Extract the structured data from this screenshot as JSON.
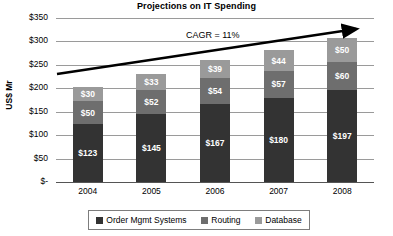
{
  "chart_data": {
    "type": "bar",
    "stacked": true,
    "title": "Projections on IT Spending",
    "xlabel": "",
    "ylabel": "US$ Mr",
    "categories": [
      "2004",
      "2005",
      "2006",
      "2007",
      "2008"
    ],
    "ytick_labels": [
      "$350",
      "$300",
      "$250",
      "$200",
      "$150",
      "$100",
      "$50",
      "$-"
    ],
    "ytick_values": [
      350,
      300,
      250,
      200,
      150,
      100,
      50,
      0
    ],
    "ylim": [
      0,
      350
    ],
    "grid": true,
    "legend_position": "bottom",
    "series": [
      {
        "name": "Order Mgmt Systems",
        "color": "#333333",
        "values": [
          123,
          145,
          167,
          180,
          197
        ],
        "labels": [
          "$123",
          "$145",
          "$167",
          "$180",
          "$197"
        ]
      },
      {
        "name": "Routing",
        "color": "#6e6e6e",
        "values": [
          50,
          52,
          54,
          57,
          60
        ],
        "labels": [
          "$50",
          "$52",
          "$54",
          "$57",
          "$60"
        ]
      },
      {
        "name": "Database",
        "color": "#9a9a9a",
        "values": [
          30,
          33,
          39,
          44,
          50
        ],
        "labels": [
          "$30",
          "$33",
          "$39",
          "$44",
          "$50"
        ]
      }
    ],
    "annotations": [
      {
        "name": "cagr-annotation",
        "text": "CAGR = 11%"
      }
    ],
    "totals": [
      203,
      230,
      260,
      281,
      307
    ]
  }
}
